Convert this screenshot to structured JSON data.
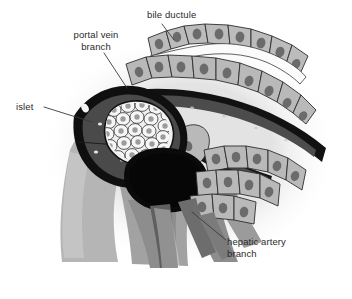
{
  "figure": {
    "width": 352,
    "height": 299,
    "background_color": "#ffffff"
  },
  "labels": [
    {
      "id": "portal-vein-branch",
      "text": "portal vein\nbranch",
      "line1": "portal vein",
      "line2": "branch",
      "x": 58,
      "y": 29,
      "align": "center"
    },
    {
      "id": "bile-ductule",
      "text": "bile ductule",
      "x": 147,
      "y": 9,
      "align": "left"
    },
    {
      "id": "islet",
      "text": "islet",
      "x": 16,
      "y": 101,
      "align": "left"
    },
    {
      "id": "hepatic-artery-branch",
      "text": "hepatic artery\nbranch",
      "line1": "hepatic artery",
      "line2": "branch",
      "x": 227,
      "y": 236,
      "align": "left"
    }
  ],
  "leader_lines": [
    {
      "id": "leader-portal-vein",
      "from": [
        104,
        62
      ],
      "to": [
        127,
        88
      ]
    },
    {
      "id": "leader-bile-ductule",
      "from": [
        160,
        23
      ],
      "to": [
        173,
        38
      ]
    },
    {
      "id": "leader-islet",
      "from": [
        44,
        106
      ],
      "to": [
        92,
        120
      ]
    },
    {
      "id": "leader-hepatic-artery",
      "from": [
        224,
        240
      ],
      "to": [
        193,
        212
      ]
    }
  ],
  "colors": {
    "background": "#ffffff",
    "vessel_wall_dark": "#111111",
    "vessel_lumen_dark": "#4c4c4c",
    "vessel_lumen_black": "#0d0d0d",
    "hepatocyte_fill": "#b9b9b9",
    "hepatocyte_nucleus": "#6b6b6b",
    "islet_fill": "#f2f2f2",
    "islet_cell_outline": "#3a3a3a",
    "connective_tissue": "#a8a8a8",
    "stroma_mid": "#8f8f8f",
    "text": "#2b2b2b",
    "leader_line": "#3a3a3a"
  },
  "structures": [
    {
      "id": "portal-vein-branch",
      "type": "vessel",
      "description": "Large oval vessel at left with thick black wall and dark gray lumen containing pale speckles"
    },
    {
      "id": "islet",
      "type": "cell-cluster",
      "description": "Rounded cluster of ~30 pale polygonal cells with dark nuclei, sitting inside the portal vein wall"
    },
    {
      "id": "bile-ductule",
      "type": "duct",
      "description": "White channel running up-right between two rows of cuboidal hepatocytes"
    },
    {
      "id": "hepatic-artery-branch",
      "type": "vessel",
      "description": "Dark gray vessel branching downward below the hepatocyte rows"
    },
    {
      "id": "hepatocyte-rows",
      "type": "epithelium",
      "description": "Rows of light gray cuboidal cells with dark oval nuclei bordering the ducts and vessels"
    },
    {
      "id": "connective-tissue",
      "type": "stroma",
      "description": "Mid-gray supporting tissue filling the lower-left and lower-center of the field"
    }
  ]
}
